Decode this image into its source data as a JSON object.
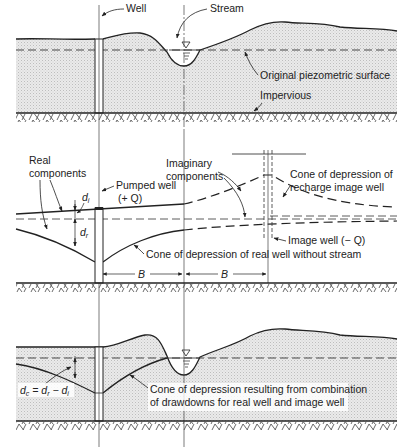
{
  "figure": {
    "panel1": {
      "labels": {
        "well": "Well",
        "stream": "Stream",
        "piezometric": "Original piezometric surface",
        "impervious": "Impervious"
      }
    },
    "panel2": {
      "labels": {
        "real_components_1": "Real",
        "real_components_2": "components",
        "imaginary_1": "Imaginary",
        "imaginary_2": "components",
        "pumped_well_1": "Pumped well",
        "pumped_well_2": "(+ Q)",
        "cone_image_1": "Cone of depression of",
        "cone_image_2": "recharge image well",
        "image_well": "Image well (− Q)",
        "cone_real": "Cone of depression of real well without stream",
        "d_i": "d",
        "d_i_sub": "i",
        "d_r": "d",
        "d_r_sub": "r",
        "B1": "B",
        "B2": "B"
      }
    },
    "panel3": {
      "labels": {
        "equation": "dₒ = dᵣ − dᵢ",
        "eq_dc": "d",
        "eq_dc_sub": "c",
        "eq_eq": " = ",
        "eq_dr": "d",
        "eq_dr_sub": "r",
        "eq_minus": " − ",
        "eq_di": "d",
        "eq_di_sub": "i",
        "cone_combined_1": "Cone of depression resulting from combination",
        "cone_combined_2": "of drawdowns for real well and image well"
      }
    },
    "colors": {
      "ink": "#222222",
      "aquifer_fill": "#e6e6e6",
      "background": "#ffffff"
    }
  }
}
